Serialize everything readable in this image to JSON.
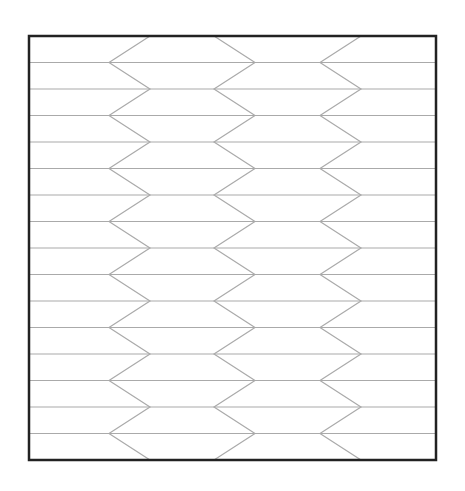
{
  "diagram": {
    "type": "hexagonal-zigzag-tessellation",
    "canvas": {
      "width": 465,
      "height": 491,
      "background": "#ffffff"
    },
    "frame": {
      "x1": 29,
      "y1": 36,
      "x2": 436,
      "y2": 460,
      "stroke": "#222222",
      "stroke_width": 2.5
    },
    "rows": 16,
    "grid_line": {
      "stroke": "#aaaaaa",
      "stroke_width": 1.2
    },
    "zigzag_stroke": "#aaaaaa",
    "zigzags": [
      {
        "name": "left-column-left-edge",
        "even_x": 150,
        "odd_x": 109
      },
      {
        "name": "left-column-right-edge",
        "even_x": 214,
        "odd_x": 255
      },
      {
        "name": "right-column-left-edge",
        "even_x": 361,
        "odd_x": 320
      }
    ]
  }
}
